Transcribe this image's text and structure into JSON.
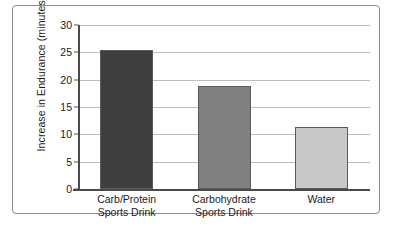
{
  "chart_data": {
    "type": "bar",
    "title": "",
    "xlabel": "",
    "ylabel": "Increase in Endurance (minutes)",
    "ylim": [
      0,
      30
    ],
    "yticks": [
      0,
      5,
      10,
      15,
      20,
      25,
      30
    ],
    "ytick_labels": [
      "0",
      "5",
      "10",
      "15",
      "20",
      "25",
      "30"
    ],
    "grid": "horizontal",
    "legend": "none",
    "categories": [
      "Carb/Protein Sports Drink",
      "Carbohydrate Sports Drink",
      "Water"
    ],
    "category_lines": [
      [
        "Carb/Protein",
        "Sports Drink"
      ],
      [
        "Carbohydrate",
        "Sports Drink"
      ],
      [
        "Water"
      ]
    ],
    "values": [
      25.4,
      18.9,
      11.3
    ],
    "bar_colors": [
      "#3f3f3f",
      "#808080",
      "#c8c8c8"
    ],
    "bar_border_color": "#5a5a5a",
    "axis_color": "#4a4a4a",
    "gridline_color": "#bdbdbd",
    "frame_color": "#8c8c8c",
    "background_color": "#ffffff"
  }
}
